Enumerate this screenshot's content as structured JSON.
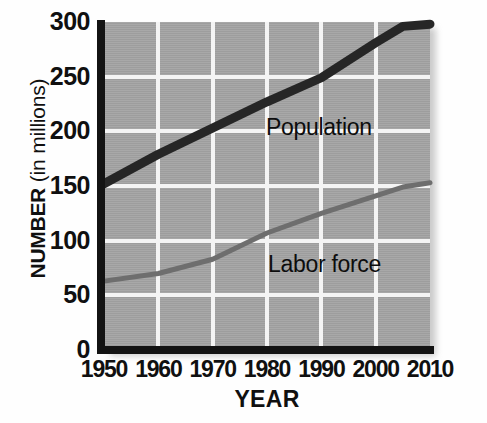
{
  "chart_data": {
    "type": "line",
    "title": "",
    "xlabel": "YEAR",
    "ylabel": "NUMBER (in millions)",
    "ylabel_bold_part": "NUMBER",
    "ylabel_regular_part": "(in millions)",
    "xlim": [
      1950,
      2010
    ],
    "ylim": [
      0,
      300
    ],
    "xticks": [
      1950,
      1960,
      1970,
      1980,
      1990,
      2000,
      2010
    ],
    "yticks": [
      0,
      50,
      100,
      150,
      200,
      250,
      300
    ],
    "grid": true,
    "legend": "inline-annotations",
    "plot_background_color": "#a3a3a3",
    "gridline_color": "#f4f4f4",
    "axis_color": "#131313",
    "x": [
      1950,
      1960,
      1970,
      1980,
      1990,
      2000,
      2005,
      2010
    ],
    "series": [
      {
        "name": "Population",
        "color": "#262626",
        "line_width": 9,
        "values": [
          152,
          179,
          203,
          227,
          249,
          281,
          296,
          298
        ]
      },
      {
        "name": "Labor force",
        "color": "#6e6e6e",
        "line_width": 5,
        "values": [
          63,
          70,
          83,
          107,
          125,
          141,
          149,
          153
        ]
      }
    ],
    "annotations": [
      {
        "text": "Population",
        "near_year": 1983,
        "near_value": 215
      },
      {
        "text": "Labor force",
        "near_year": 1984,
        "near_value": 88
      }
    ]
  },
  "axis": {
    "y_tick_labels": [
      "300",
      "250",
      "200",
      "150",
      "100",
      "50",
      "0"
    ],
    "x_tick_labels": [
      "1950",
      "1960",
      "1970",
      "1980",
      "1990",
      "2000",
      "2010"
    ]
  }
}
